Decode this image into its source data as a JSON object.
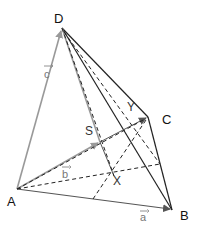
{
  "diagram": {
    "type": "tetrahedron-vector-figure",
    "vertices": {
      "A": {
        "label": "A",
        "x": 17,
        "y": 189
      },
      "B": {
        "label": "B",
        "x": 172,
        "y": 210
      },
      "C": {
        "label": "C",
        "x": 148,
        "y": 117
      },
      "D": {
        "label": "D",
        "x": 62,
        "y": 28
      }
    },
    "points": {
      "S": {
        "label": "S",
        "x": 100,
        "y": 142
      },
      "X": {
        "label": "X",
        "x": 114,
        "y": 176
      },
      "Y": {
        "label": "Y",
        "x": 130,
        "y": 108
      }
    },
    "vectors": {
      "a": {
        "label": "a",
        "from": "A",
        "to": "B"
      },
      "b": {
        "label": "b",
        "from": "A",
        "to": "S"
      },
      "c": {
        "label": "c",
        "from": "A",
        "to": "D"
      }
    },
    "colors": {
      "edge": "#222222",
      "vector": "#999999",
      "dashed": "#222222"
    }
  }
}
